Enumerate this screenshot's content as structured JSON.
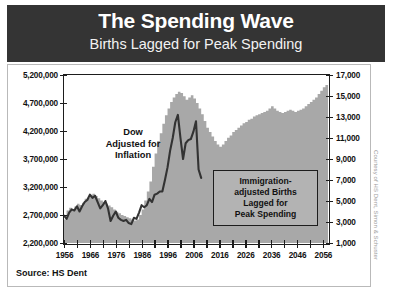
{
  "header": {
    "title": "The Spending Wave",
    "subtitle": "Births Lagged for Peak Spending",
    "band_color": "#343434"
  },
  "annotations": {
    "dow": "Dow\nAdjusted for\nInflation",
    "dow_line1": "Dow",
    "dow_line2": "Adjusted for",
    "dow_line3": "Inflation",
    "births_line1": "Immigration-",
    "births_line2": "adjusted Births",
    "births_line3": "Lagged for",
    "births_line4": "Peak Spending"
  },
  "source": "Source: HS Dent",
  "credit": "Courtesy of HS Dent, Simon & Schuster",
  "colors": {
    "area": "#a8a8a8",
    "line": "#333333",
    "frame": "#1d1d1d",
    "box_fill": "#b3b3b3"
  },
  "chart_data": {
    "type": "area",
    "title": "The Spending Wave",
    "subtitle": "Births Lagged for Peak Spending",
    "xlabel": "",
    "ylabel": "Immigration-adjusted Births Lagged for Peak Spending",
    "y2label": "Dow Adjusted for Inflation",
    "xlim": [
      1956,
      2058
    ],
    "ylim": [
      2200000,
      5200000
    ],
    "y2lim": [
      1000,
      17000
    ],
    "grid": false,
    "legend": "none",
    "x_ticks": [
      1956,
      1966,
      1976,
      1986,
      1996,
      2006,
      2016,
      2026,
      2036,
      2046,
      2056
    ],
    "x_minor_step": 5,
    "y_left_ticks": [
      "2,200,000",
      "2,700,000",
      "3,200,000",
      "3,700,000",
      "4,200,000",
      "4,700,000",
      "5,200,000"
    ],
    "y_right_ticks": [
      "1,000",
      "3,000",
      "5,000",
      "7,000",
      "9,000",
      "11,000",
      "13,000",
      "15,000",
      "17,000"
    ],
    "series": [
      {
        "name": "Immigration-adjusted Births Lagged for Peak Spending",
        "type": "area",
        "axis": "left",
        "color": "#a8a8a8",
        "x": [
          1956,
          1957,
          1958,
          1959,
          1960,
          1961,
          1962,
          1963,
          1964,
          1965,
          1966,
          1967,
          1968,
          1969,
          1970,
          1971,
          1972,
          1973,
          1974,
          1975,
          1976,
          1977,
          1978,
          1979,
          1980,
          1981,
          1982,
          1983,
          1984,
          1985,
          1986,
          1987,
          1988,
          1989,
          1990,
          1991,
          1992,
          1993,
          1994,
          1995,
          1996,
          1997,
          1998,
          1999,
          2000,
          2001,
          2002,
          2003,
          2004,
          2005,
          2006,
          2007,
          2008,
          2009,
          2010,
          2011,
          2012,
          2013,
          2014,
          2015,
          2016,
          2017,
          2018,
          2019,
          2020,
          2021,
          2022,
          2023,
          2024,
          2025,
          2026,
          2027,
          2028,
          2029,
          2030,
          2031,
          2032,
          2033,
          2034,
          2035,
          2036,
          2037,
          2038,
          2039,
          2040,
          2041,
          2042,
          2043,
          2044,
          2045,
          2046,
          2047,
          2048,
          2049,
          2050,
          2051,
          2052,
          2053,
          2054,
          2055,
          2056,
          2057
        ],
        "values": [
          2620000,
          2780000,
          2830000,
          2800000,
          2850000,
          2900000,
          2880000,
          2920000,
          2990000,
          3010000,
          3060000,
          3080000,
          3040000,
          3000000,
          2960000,
          2930000,
          2900000,
          2870000,
          2840000,
          2800000,
          2760000,
          2730000,
          2700000,
          2680000,
          2660000,
          2640000,
          2620000,
          2600000,
          2620000,
          2700000,
          2800000,
          2960000,
          3120000,
          3300000,
          3560000,
          3800000,
          4020000,
          4160000,
          4330000,
          4480000,
          4600000,
          4720000,
          4800000,
          4860000,
          4900000,
          4880000,
          4820000,
          4760000,
          4800000,
          4840000,
          4780000,
          4700000,
          4600000,
          4500000,
          4380000,
          4260000,
          4180000,
          4100000,
          4020000,
          3960000,
          3920000,
          3960000,
          4020000,
          4080000,
          4120000,
          4180000,
          4220000,
          4260000,
          4300000,
          4340000,
          4360000,
          4400000,
          4420000,
          4460000,
          4480000,
          4500000,
          4520000,
          4540000,
          4560000,
          4600000,
          4640000,
          4600000,
          4560000,
          4540000,
          4520000,
          4540000,
          4560000,
          4580000,
          4560000,
          4540000,
          4560000,
          4580000,
          4600000,
          4640000,
          4680000,
          4720000,
          4760000,
          4800000,
          4860000,
          4920000,
          4980000,
          5020000
        ]
      },
      {
        "name": "Dow Adjusted for Inflation",
        "type": "line",
        "axis": "right",
        "color": "#333333",
        "x": [
          1956,
          1957,
          1958,
          1959,
          1960,
          1961,
          1962,
          1963,
          1964,
          1965,
          1966,
          1967,
          1968,
          1969,
          1970,
          1971,
          1972,
          1973,
          1974,
          1975,
          1976,
          1977,
          1978,
          1979,
          1980,
          1981,
          1982,
          1983,
          1984,
          1985,
          1986,
          1987,
          1988,
          1989,
          1990,
          1991,
          1992,
          1993,
          1994,
          1995,
          1996,
          1997,
          1998,
          1999,
          2000,
          2001,
          2002,
          2003,
          2004,
          2005,
          2006,
          2007,
          2008,
          2009
        ],
        "values": [
          3600,
          3300,
          3900,
          4200,
          4100,
          4500,
          4000,
          4500,
          4900,
          5100,
          5600,
          5300,
          5500,
          4900,
          4300,
          4600,
          5000,
          4300,
          3100,
          3600,
          4000,
          3400,
          3200,
          3100,
          3200,
          2900,
          2800,
          3400,
          3300,
          3900,
          4600,
          4400,
          4600,
          5200,
          4900,
          5600,
          5700,
          5900,
          5900,
          7000,
          8200,
          9800,
          11000,
          12500,
          13200,
          11000,
          9000,
          10500,
          10800,
          10900,
          11600,
          12600,
          8000,
          7200
        ]
      }
    ]
  }
}
